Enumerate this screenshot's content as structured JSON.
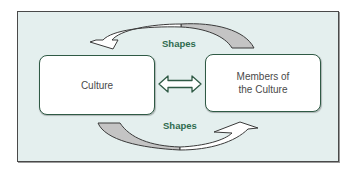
{
  "diagram": {
    "nodes": [
      {
        "id": "culture",
        "label": "Culture"
      },
      {
        "id": "members",
        "label": "Members of the Culture",
        "lines": [
          "Members of",
          "the Culture"
        ]
      }
    ],
    "edges": [
      {
        "from": "members",
        "to": "culture",
        "label": "Shapes",
        "position": "top"
      },
      {
        "from": "culture",
        "to": "members",
        "label": "Shapes",
        "position": "bottom"
      },
      {
        "from": "culture",
        "to": "members",
        "label": "",
        "type": "bidirectional"
      }
    ],
    "colors": {
      "background": "#e4efee",
      "frame_border": "#4a4a4a",
      "box_border": "#2f5a45",
      "label_text": "#2e6b4e",
      "arrow_shaded": "#c4c4c4",
      "arrow_white": "#ffffff"
    }
  }
}
